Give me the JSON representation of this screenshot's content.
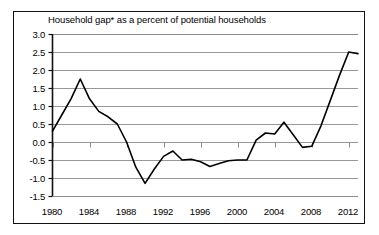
{
  "chart_data": {
    "type": "line",
    "title": "Household gap* as a percent of potential households",
    "xlabel": "",
    "ylabel": "",
    "xlim": [
      1980,
      2013
    ],
    "ylim": [
      -1.5,
      3.0
    ],
    "grid": true,
    "legend": "none",
    "x_ticks": [
      "1980",
      "1984",
      "1988",
      "1992",
      "1996",
      "2000",
      "2004",
      "2008",
      "2012"
    ],
    "x_tick_values": [
      1980,
      1984,
      1988,
      1992,
      1996,
      2000,
      2004,
      2008,
      2012
    ],
    "y_ticks": [
      "3.0",
      "2.5",
      "2.0",
      "1.5",
      "1.0",
      "0.5",
      "0.0",
      "-0.5",
      "-1.0",
      "-1.5"
    ],
    "y_tick_values": [
      3.0,
      2.5,
      2.0,
      1.5,
      1.0,
      0.5,
      0.0,
      -0.5,
      -1.0,
      -1.5
    ],
    "series": [
      {
        "name": "Household gap as a percent of potential households",
        "color": "#000000",
        "x": [
          1980,
          1981,
          1982,
          1983,
          1984,
          1985,
          1986,
          1987,
          1988,
          1989,
          1990,
          1991,
          1992,
          1993,
          1994,
          1995,
          1996,
          1997,
          1998,
          1999,
          2000,
          2001,
          2002,
          2003,
          2004,
          2005,
          2006,
          2007,
          2008,
          2009,
          2010,
          2011,
          2012,
          2013
        ],
        "values": [
          0.3,
          0.75,
          1.2,
          1.75,
          1.2,
          0.85,
          0.7,
          0.5,
          0.0,
          -0.7,
          -1.15,
          -0.75,
          -0.4,
          -0.25,
          -0.5,
          -0.48,
          -0.55,
          -0.68,
          -0.6,
          -0.52,
          -0.5,
          -0.5,
          0.05,
          0.25,
          0.22,
          0.55,
          0.2,
          -0.15,
          -0.12,
          0.45,
          1.15,
          1.85,
          2.5,
          2.45
        ]
      }
    ],
    "annotations": []
  },
  "axis": {
    "y_labels": [
      "3.0",
      "2.5",
      "2.0",
      "1.5",
      "1.0",
      "0.5",
      "0.0",
      "-0.5",
      "-1.0",
      "-1.5"
    ],
    "x_labels": [
      "1980",
      "1984",
      "1988",
      "1992",
      "1996",
      "2000",
      "2004",
      "2008",
      "2012"
    ]
  },
  "style": {
    "line_color": "#000000",
    "grid_color": "#8c8c8c",
    "axis_color": "#111111",
    "background": "#ffffff"
  }
}
